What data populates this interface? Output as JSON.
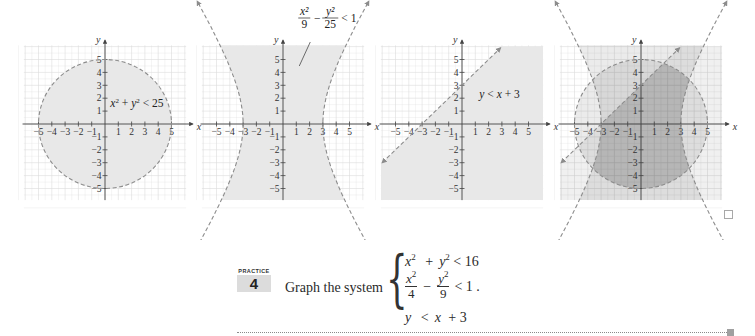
{
  "figure": {
    "graphs": [
      {
        "id": "circle",
        "annotation": {
          "text": "x² + y² < 25",
          "parts": [
            "x",
            "2",
            " + ",
            "y",
            "2",
            " < 25"
          ]
        },
        "inequality": "x^2 + y^2 < 25",
        "boundary": "dashed circle, radius 5",
        "shaded": "inside circle"
      },
      {
        "id": "hyperbola",
        "annotation": {
          "num1": "x²",
          "den1": "9",
          "minus": "−",
          "num2": "y²",
          "den2": "25",
          "rel": "< 1"
        },
        "inequality": "x^2/9 - y^2/25 < 1",
        "boundary": "dashed hyperbola, vertices (±3, 0)",
        "shaded": "between branches"
      },
      {
        "id": "line",
        "annotation": {
          "text": "y < x + 3",
          "parts": [
            "y",
            " < ",
            "x",
            " + 3"
          ]
        },
        "inequality": "y < x + 3",
        "boundary": "dashed line through (-3,0) and (0,3)",
        "shaded": "below line"
      },
      {
        "id": "intersection",
        "annotation": null,
        "inequality": "all three",
        "shaded": "overlap darkest"
      }
    ],
    "axes": {
      "x_label": "x",
      "y_label": "y",
      "x_ticks": [
        "−5",
        "−4",
        "−3",
        "−2",
        "−1",
        "1",
        "2",
        "3",
        "4",
        "5"
      ],
      "y_ticks": [
        "5",
        "4",
        "3",
        "2",
        "1",
        "−1",
        "−2",
        "−3",
        "−4",
        "−5"
      ]
    },
    "colors": {
      "grid": "#dcdcdc",
      "shade": "#e8e8e8",
      "shade_dark": "#c4c4c4",
      "boundary": "#8c8c8c",
      "axis": "#444444"
    }
  },
  "practice": {
    "label": "PRACTICE",
    "number": "4",
    "prompt": "Graph the system",
    "system": {
      "eq1": {
        "a": "x",
        "a_exp": "2",
        "op": "+",
        "b": "y",
        "b_exp": "2",
        "rel": "< 16"
      },
      "eq2": {
        "num1": "x",
        "num1_exp": "2",
        "den1": "4",
        "op": "−",
        "num2": "y",
        "num2_exp": "2",
        "den2": "9",
        "rel": "< 1 ."
      },
      "eq3": {
        "a": "y",
        "rel": "<",
        "b": "x",
        "rest": "+ 3"
      }
    }
  },
  "chart_data": [
    {
      "type": "region",
      "title": "x² + y² < 25",
      "xlabel": "x",
      "ylabel": "y",
      "xlim": [
        -6,
        6
      ],
      "ylim": [
        -6,
        6
      ],
      "grid": true,
      "boundary": {
        "kind": "circle",
        "center": [
          0,
          0
        ],
        "radius": 5,
        "style": "dashed"
      },
      "shaded": "interior"
    },
    {
      "type": "region",
      "title": "x²/9 − y²/25 < 1",
      "xlabel": "x",
      "ylabel": "y",
      "xlim": [
        -6,
        6
      ],
      "ylim": [
        -6,
        6
      ],
      "grid": true,
      "boundary": {
        "kind": "hyperbola",
        "a": 3,
        "b": 5,
        "style": "dashed",
        "vertices": [
          [
            -3,
            0
          ],
          [
            3,
            0
          ]
        ]
      },
      "shaded": "between branches"
    },
    {
      "type": "region",
      "title": "y < x + 3",
      "xlabel": "x",
      "ylabel": "y",
      "xlim": [
        -6,
        6
      ],
      "ylim": [
        -6,
        6
      ],
      "grid": true,
      "boundary": {
        "kind": "line",
        "slope": 1,
        "intercept": 3,
        "style": "dashed",
        "points": [
          [
            -3,
            0
          ],
          [
            0,
            3
          ]
        ]
      },
      "shaded": "below"
    },
    {
      "type": "region",
      "title": "Intersection of all three",
      "xlabel": "x",
      "ylabel": "y",
      "xlim": [
        -6,
        6
      ],
      "ylim": [
        -6,
        6
      ],
      "grid": true,
      "boundaries": [
        "circle r=5",
        "hyperbola x²/9−y²/25=1",
        "line y=x+3"
      ],
      "shaded": "overlap of all three regions (darkest)"
    }
  ]
}
